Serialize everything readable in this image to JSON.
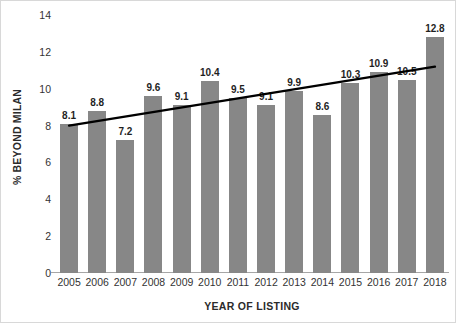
{
  "chart_data": {
    "type": "bar",
    "title": "",
    "subtitle": "",
    "xlabel": "YEAR OF LISTING",
    "ylabel": "% BEYOND MILAN",
    "categories": [
      "2005",
      "2006",
      "2007",
      "2008",
      "2009",
      "2010",
      "2011",
      "2012",
      "2013",
      "2014",
      "2015",
      "2016",
      "2017",
      "2018"
    ],
    "values": [
      8.1,
      8.8,
      7.2,
      9.6,
      9.1,
      10.4,
      9.5,
      9.1,
      9.9,
      8.6,
      10.3,
      10.9,
      10.5,
      12.8
    ],
    "data_labels": [
      "8.1",
      "8.8",
      "7.2",
      "9.6",
      "9.1",
      "10.4",
      "9.5",
      "9.1",
      "9.9",
      "8.6",
      "10.3",
      "10.9",
      "10.5",
      "12.8"
    ],
    "ylim": [
      0,
      14
    ],
    "yticks": [
      0,
      2,
      4,
      6,
      8,
      10,
      12,
      14
    ],
    "ytick_labels": [
      "0",
      "2",
      "4",
      "6",
      "8",
      "10",
      "12",
      "14"
    ],
    "grid": false,
    "legend": null,
    "legend_position": "none",
    "series": [
      {
        "name": "% Beyond Milan",
        "kind": "bar",
        "values": [
          8.1,
          8.8,
          7.2,
          9.6,
          9.1,
          10.4,
          9.5,
          9.1,
          9.9,
          8.6,
          10.3,
          10.9,
          10.5,
          12.8
        ],
        "color": "#878787"
      },
      {
        "name": "Linear trendline",
        "kind": "line",
        "start_value": 8.0,
        "end_value": 11.2,
        "color": "#000000"
      }
    ],
    "colors": {
      "bar": "#878787",
      "trendline": "#000000",
      "axis": "#a6a6a6",
      "text": "#333333",
      "title_text": "#2b2b2b",
      "background": "#ffffff"
    }
  }
}
